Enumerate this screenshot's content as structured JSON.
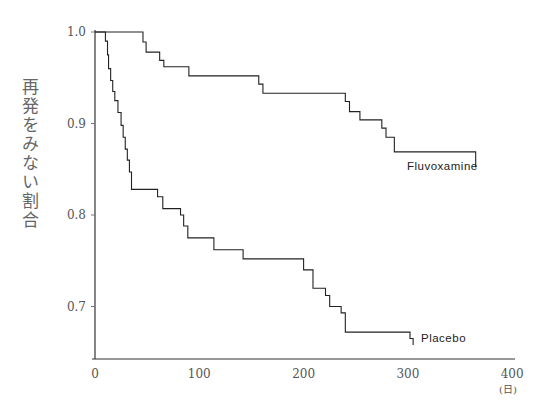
{
  "chart_data": {
    "type": "line",
    "subtype": "kaplan-meier step",
    "title": "",
    "xlabel": "(日)",
    "ylabel": "再発をみない割合",
    "xlim": [
      0,
      400
    ],
    "ylim": [
      0.65,
      1.0
    ],
    "x_ticks": [
      "0",
      "100",
      "200",
      "300",
      "400"
    ],
    "y_ticks": [
      "0.7",
      "0.8",
      "0.9",
      "1.0"
    ],
    "grid": false,
    "legend": "inline labels at line ends",
    "series": [
      {
        "name": "Fluvoxamine",
        "steps": [
          [
            0,
            1.0
          ],
          [
            46,
            0.989
          ],
          [
            49,
            0.978
          ],
          [
            62,
            0.969
          ],
          [
            66,
            0.962
          ],
          [
            90,
            0.952
          ],
          [
            157,
            0.943
          ],
          [
            161,
            0.933
          ],
          [
            240,
            0.924
          ],
          [
            244,
            0.913
          ],
          [
            254,
            0.904
          ],
          [
            275,
            0.895
          ],
          [
            279,
            0.885
          ],
          [
            287,
            0.869
          ],
          [
            365,
            0.852
          ]
        ]
      },
      {
        "name": "Placebo",
        "steps": [
          [
            0,
            1.0
          ],
          [
            10,
            0.99
          ],
          [
            12,
            0.975
          ],
          [
            13,
            0.96
          ],
          [
            15,
            0.947
          ],
          [
            17,
            0.935
          ],
          [
            19,
            0.925
          ],
          [
            22,
            0.912
          ],
          [
            25,
            0.898
          ],
          [
            27,
            0.885
          ],
          [
            29,
            0.872
          ],
          [
            31,
            0.86
          ],
          [
            33,
            0.847
          ],
          [
            35,
            0.828
          ],
          [
            60,
            0.82
          ],
          [
            65,
            0.807
          ],
          [
            82,
            0.8
          ],
          [
            85,
            0.788
          ],
          [
            89,
            0.775
          ],
          [
            114,
            0.762
          ],
          [
            142,
            0.752
          ],
          [
            200,
            0.74
          ],
          [
            209,
            0.72
          ],
          [
            221,
            0.712
          ],
          [
            225,
            0.7
          ],
          [
            236,
            0.693
          ],
          [
            240,
            0.672
          ],
          [
            302,
            0.665
          ],
          [
            305,
            0.658
          ]
        ]
      }
    ]
  },
  "labels": {
    "ylabel": "再発をみない割合",
    "xunit": "(日)",
    "fluvoxamine": "Fluvoxamine",
    "placebo": "Placebo"
  }
}
